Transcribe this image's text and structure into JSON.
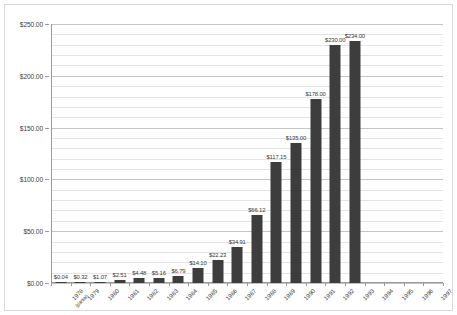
{
  "chart_data": {
    "type": "bar",
    "title": "",
    "subtitle": "",
    "xlabel": "",
    "ylabel": "",
    "ylim": [
      0,
      250
    ],
    "grid": true,
    "legend": "none",
    "y_major_ticks": [
      "$0.00",
      "$50.00",
      "$100.00",
      "$150.00",
      "$200.00",
      "$250.00"
    ],
    "y_major_values": [
      0,
      50,
      100,
      150,
      200,
      250
    ],
    "y_minor_step": 10,
    "categories": [
      "1978 (partial)",
      "1979",
      "1980",
      "1981",
      "1982",
      "1983",
      "1984",
      "1985",
      "1986",
      "1987",
      "1988",
      "1989",
      "1990",
      "1991",
      "1992",
      "1993",
      "1994",
      "1995",
      "1996",
      "1997"
    ],
    "category_sublabels": [
      "(partial)",
      "",
      "",
      "",
      "",
      "",
      "",
      "",
      "",
      "",
      "",
      "",
      "",
      "",
      "",
      "",
      "",
      "",
      "",
      ""
    ],
    "category_main": [
      "1978",
      "1979",
      "1980",
      "1981",
      "1982",
      "1983",
      "1984",
      "1985",
      "1986",
      "1987",
      "1988",
      "1989",
      "1990",
      "1991",
      "1992",
      "1993",
      "1994",
      "1995",
      "1996",
      "1997"
    ],
    "values": [
      0.04,
      0.32,
      1.07,
      2.51,
      4.48,
      5.16,
      6.79,
      14.1,
      22.23,
      34.91,
      66.12,
      117.15,
      135.0,
      178.0,
      230.0,
      234.0,
      null,
      null,
      null,
      null
    ],
    "value_labels": [
      "$0.04",
      "$0.32",
      "$1.07",
      "$2.51",
      "$4.48",
      "$5.16",
      "$6.79",
      "$14.10",
      "$22.23",
      "$34.91",
      "$66.12",
      "$117.15",
      "$135.00",
      "$178.00",
      "$230.00",
      "$234.00",
      "",
      "",
      "",
      ""
    ],
    "series_color": "#3d3d3d"
  }
}
